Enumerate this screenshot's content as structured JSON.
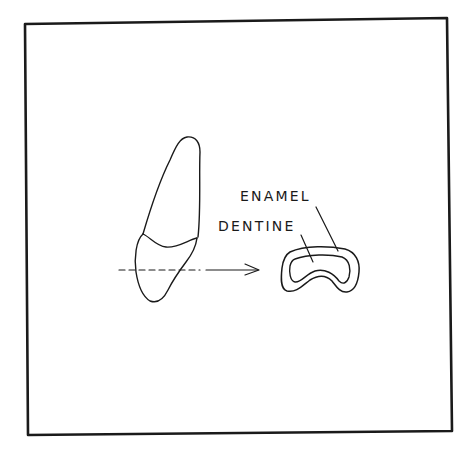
{
  "figure": {
    "type": "line-drawing",
    "colors": {
      "ink": "#1a1a1a",
      "background": "#ffffff"
    },
    "frame": {
      "corners": [
        [
          25,
          24
        ],
        [
          447,
          18
        ],
        [
          452,
          431
        ],
        [
          28,
          435
        ]
      ]
    },
    "labels": {
      "enamel": "ENAMEL",
      "dentine": "DENTINE"
    },
    "section_indicator": {
      "style": "dashed line through tooth continuing to solid arrow",
      "direction": "right"
    }
  }
}
